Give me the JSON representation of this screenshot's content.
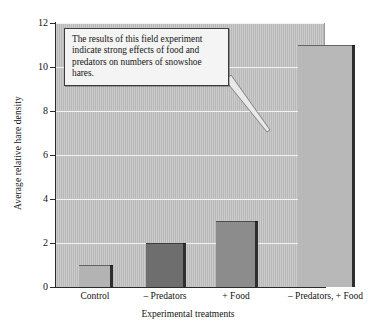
{
  "chart_data": {
    "type": "bar",
    "title": "",
    "xlabel": "Experimental treatments",
    "ylabel": "Average relative hare density",
    "categories": [
      "Control",
      "– Predators",
      "+ Food",
      "– Predators, + Food"
    ],
    "values": [
      1,
      2,
      3,
      11
    ],
    "ylim": [
      0,
      12
    ],
    "yticks": [
      0,
      2,
      4,
      6,
      8,
      10,
      12
    ],
    "ytick_labels": [
      "0",
      "2",
      "4",
      "6",
      "8",
      "10",
      "12"
    ],
    "grid": "horizontal",
    "legend": "none",
    "bar_colors": [
      "#b3b3b3",
      "#6e6e6e",
      "#8c8c8c",
      "#b8b8b8"
    ],
    "bar_edge_color": "#2e2e2e",
    "plot_background": "#c2c2c2",
    "gridline_color": "#f2f2f2",
    "annotations": [
      {
        "name": "callout",
        "text": "The results of this field experiment indicate strong effects of food and predators on numbers of snowshoe hares.",
        "points_to": "– Predators, + Food"
      }
    ]
  }
}
